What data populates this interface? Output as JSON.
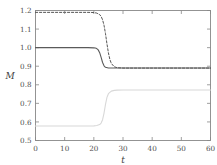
{
  "chart_data": {
    "type": "line",
    "title": "",
    "xlabel": "t",
    "ylabel": "M",
    "xlim": [
      0,
      60
    ],
    "ylim": [
      0.5,
      1.2
    ],
    "grid": false,
    "legend": "none",
    "xticks": [
      0,
      10,
      20,
      30,
      40,
      50,
      60
    ],
    "xtick_labels": [
      "0",
      "10",
      "20",
      "30",
      "40",
      "50",
      "60"
    ],
    "yticks": [
      0.5,
      0.6,
      0.7,
      0.8,
      0.9,
      1.0,
      1.1,
      1.2
    ],
    "ytick_labels": [
      "0.5",
      "0.6",
      "0.7",
      "0.8",
      "0.9",
      "1.0",
      "1.1",
      "1.2"
    ],
    "series": [
      {
        "name": "dashed-upper",
        "style": "dashed",
        "color": "#555555",
        "description": "steps down from 1.19 to 0.89 near t=24",
        "x": [
          0,
          5,
          10,
          15,
          18,
          20,
          21,
          22,
          22.5,
          23,
          23.5,
          24,
          24.5,
          25,
          25.5,
          26,
          27,
          28,
          30,
          35,
          40,
          45,
          50,
          55,
          60
        ],
        "y": [
          1.19,
          1.19,
          1.19,
          1.19,
          1.19,
          1.189,
          1.186,
          1.178,
          1.168,
          1.15,
          1.12,
          1.075,
          1.02,
          0.972,
          0.936,
          0.915,
          0.897,
          0.892,
          0.89,
          0.89,
          0.89,
          0.89,
          0.89,
          0.89,
          0.89
        ]
      },
      {
        "name": "solid-middle",
        "style": "solid",
        "color": "#5a5a5a",
        "description": "steps down from 1.00 to 0.89 near t=22",
        "x": [
          0,
          5,
          10,
          15,
          18,
          20,
          20.5,
          21,
          21.5,
          22,
          22.5,
          23,
          23.5,
          24,
          25,
          26,
          28,
          30,
          35,
          40,
          45,
          50,
          55,
          60
        ],
        "y": [
          1.0,
          1.0,
          1.0,
          1.0,
          1.0,
          0.999,
          0.998,
          0.995,
          0.988,
          0.973,
          0.948,
          0.92,
          0.902,
          0.894,
          0.89,
          0.89,
          0.89,
          0.89,
          0.89,
          0.89,
          0.89,
          0.89,
          0.89,
          0.89
        ]
      },
      {
        "name": "light-lower",
        "style": "solid",
        "color": "#d8d8d8",
        "description": "steps up from 0.58 to 0.77 near t=23",
        "x": [
          0,
          5,
          10,
          15,
          18,
          20,
          21,
          22,
          22.5,
          23,
          23.5,
          24,
          24.5,
          25,
          26,
          27,
          28,
          30,
          35,
          40,
          45,
          50,
          55,
          60
        ],
        "y": [
          0.578,
          0.578,
          0.578,
          0.578,
          0.578,
          0.579,
          0.581,
          0.586,
          0.594,
          0.612,
          0.648,
          0.695,
          0.732,
          0.752,
          0.766,
          0.77,
          0.771,
          0.772,
          0.772,
          0.772,
          0.772,
          0.772,
          0.772,
          0.772
        ]
      }
    ]
  },
  "axes": {
    "frame_color": "#888888",
    "tick_color": "#888888"
  }
}
